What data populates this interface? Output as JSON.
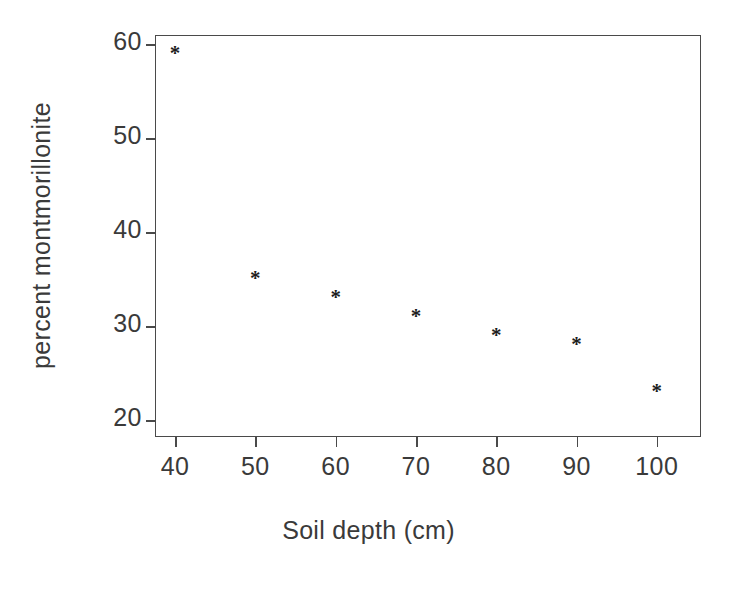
{
  "chart_data": {
    "type": "scatter",
    "title": "",
    "xlabel": "Soil depth (cm)",
    "ylabel": "percent montmorillonite",
    "x": [
      40,
      50,
      60,
      70,
      80,
      90,
      100
    ],
    "values": [
      59,
      35,
      33,
      31,
      29,
      28,
      23
    ],
    "series": [
      {
        "name": "percent montmorillonite",
        "points": [
          {
            "x": 40,
            "y": 59
          },
          {
            "x": 50,
            "y": 35
          },
          {
            "x": 60,
            "y": 33
          },
          {
            "x": 70,
            "y": 31
          },
          {
            "x": 80,
            "y": 29
          },
          {
            "x": 90,
            "y": 28
          },
          {
            "x": 100,
            "y": 23
          }
        ]
      }
    ],
    "xticks": [
      "40",
      "50",
      "60",
      "70",
      "80",
      "90",
      "100"
    ],
    "yticks": [
      "20",
      "30",
      "40",
      "50",
      "60"
    ],
    "xtick_values": [
      40,
      50,
      60,
      70,
      80,
      90,
      100
    ],
    "ytick_values": [
      20,
      30,
      40,
      50,
      60
    ],
    "xlim": [
      37.5,
      105.5
    ],
    "ylim": [
      18.2,
      61.0
    ],
    "grid": false,
    "legend": false,
    "legend_position": "none",
    "marker": "*",
    "marker_name": "asterisk-marker",
    "colors": {
      "background": "#ffffff",
      "axis": "#4a4a4a",
      "text": "#3a3a3a",
      "marker": "#1d1d1d"
    }
  }
}
